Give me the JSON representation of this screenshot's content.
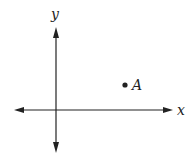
{
  "diagram": {
    "type": "coordinate-plane",
    "axes": {
      "x_label": "x",
      "y_label": "y"
    },
    "points": [
      {
        "label": "A",
        "quadrant": "I"
      }
    ],
    "colors": {
      "stroke": "#222222",
      "background": "#ffffff"
    }
  }
}
